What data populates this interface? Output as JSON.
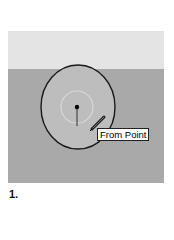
{
  "viewport": {
    "colors": {
      "sky": "#e4e4e4",
      "ground": "#a9a9a9",
      "circle_fill": "#bdbdbd",
      "circle_stroke": "#1a1a1a",
      "inference_ring": "#d8d8d8"
    }
  },
  "tool": {
    "cursor_icon": "pencil-icon",
    "tooltip": "From Point"
  },
  "caption": {
    "step_number": "1."
  }
}
